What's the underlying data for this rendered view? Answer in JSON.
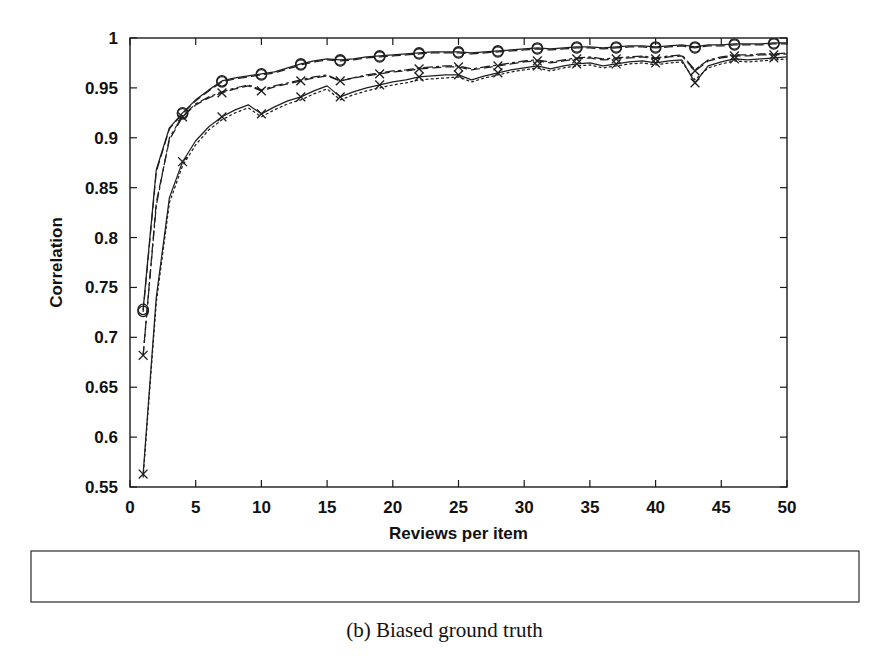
{
  "figure": {
    "caption": "(b) Biased ground truth"
  },
  "chart_data": {
    "type": "line",
    "title": "",
    "xlabel": "Reviews per item",
    "ylabel": "Correlation",
    "xlim": [
      0,
      50
    ],
    "ylim": [
      0.55,
      1.0
    ],
    "xticks": [
      0,
      5,
      10,
      15,
      20,
      25,
      30,
      35,
      40,
      45,
      50
    ],
    "xticklabels": [
      "0",
      "5",
      "10",
      "15",
      "20",
      "25",
      "30",
      "35",
      "40",
      "45",
      "50"
    ],
    "yticks": [
      0.55,
      0.6,
      0.65,
      0.7,
      0.75,
      0.8,
      0.85,
      0.9,
      0.95,
      1.0
    ],
    "yticklabels": [
      "0.55",
      "0.6",
      "0.65",
      "0.7",
      "0.75",
      "0.8",
      "0.85",
      "0.9",
      "0.95",
      "1"
    ],
    "grid": false,
    "legend_position": "below-axes",
    "ticks_direction": "in",
    "frame": "box",
    "x": [
      1,
      2,
      3,
      4,
      5,
      6,
      7,
      8,
      9,
      10,
      11,
      12,
      13,
      14,
      15,
      16,
      17,
      18,
      19,
      20,
      21,
      22,
      23,
      24,
      25,
      26,
      27,
      28,
      29,
      30,
      31,
      32,
      33,
      34,
      35,
      36,
      37,
      38,
      39,
      40,
      41,
      42,
      43,
      44,
      45,
      46,
      47,
      48,
      49,
      50
    ],
    "series": [
      {
        "name": "Mean",
        "linestyle": "dotted",
        "marker": "none",
        "marker_every": 0,
        "color": "#1f1f1f",
        "values": [
          0.56,
          0.735,
          0.835,
          0.872,
          0.893,
          0.908,
          0.918,
          0.925,
          0.93,
          0.921,
          0.928,
          0.934,
          0.938,
          0.944,
          0.949,
          0.938,
          0.943,
          0.947,
          0.95,
          0.953,
          0.955,
          0.958,
          0.959,
          0.96,
          0.961,
          0.956,
          0.96,
          0.963,
          0.966,
          0.968,
          0.97,
          0.967,
          0.97,
          0.972,
          0.973,
          0.97,
          0.972,
          0.974,
          0.975,
          0.973,
          0.975,
          0.976,
          0.958,
          0.97,
          0.974,
          0.977,
          0.976,
          0.977,
          0.978,
          0.979
        ]
      },
      {
        "name": "Bias adjusted mean",
        "linestyle": "dashdot",
        "marker": "none",
        "marker_every": 0,
        "color": "#1f1f1f",
        "values": [
          0.682,
          0.832,
          0.9,
          0.922,
          0.934,
          0.941,
          0.946,
          0.95,
          0.953,
          0.948,
          0.952,
          0.955,
          0.958,
          0.961,
          0.963,
          0.957,
          0.96,
          0.963,
          0.965,
          0.967,
          0.968,
          0.97,
          0.971,
          0.972,
          0.972,
          0.969,
          0.971,
          0.973,
          0.975,
          0.977,
          0.978,
          0.976,
          0.978,
          0.98,
          0.981,
          0.979,
          0.98,
          0.981,
          0.982,
          0.98,
          0.982,
          0.983,
          0.968,
          0.978,
          0.981,
          0.983,
          0.983,
          0.984,
          0.984,
          0.985
        ]
      },
      {
        "name": "Factor analysis",
        "linestyle": "solid",
        "marker": "circle",
        "marker_every": 3,
        "color": "#1f1f1f",
        "values": [
          0.728,
          0.868,
          0.91,
          0.925,
          0.938,
          0.948,
          0.957,
          0.96,
          0.962,
          0.964,
          0.966,
          0.97,
          0.974,
          0.977,
          0.979,
          0.978,
          0.979,
          0.981,
          0.982,
          0.983,
          0.984,
          0.985,
          0.986,
          0.986,
          0.986,
          0.985,
          0.986,
          0.987,
          0.988,
          0.989,
          0.99,
          0.989,
          0.99,
          0.991,
          0.991,
          0.99,
          0.991,
          0.992,
          0.992,
          0.991,
          0.992,
          0.993,
          0.991,
          0.993,
          0.993,
          0.994,
          0.994,
          0.994,
          0.995,
          0.995
        ]
      },
      {
        "name": "Smoothed factor analysis",
        "linestyle": "dashed",
        "marker": "circle",
        "marker_every": 3,
        "color": "#1f1f1f",
        "values": [
          0.726,
          0.866,
          0.909,
          0.924,
          0.937,
          0.947,
          0.956,
          0.959,
          0.961,
          0.963,
          0.965,
          0.969,
          0.973,
          0.976,
          0.978,
          0.977,
          0.978,
          0.98,
          0.981,
          0.982,
          0.983,
          0.984,
          0.985,
          0.985,
          0.985,
          0.984,
          0.985,
          0.986,
          0.987,
          0.988,
          0.989,
          0.988,
          0.989,
          0.99,
          0.99,
          0.989,
          0.99,
          0.991,
          0.991,
          0.99,
          0.991,
          0.992,
          0.99,
          0.992,
          0.992,
          0.993,
          0.993,
          0.993,
          0.994,
          0.994
        ]
      },
      {
        "name": "Asymptotic consensus",
        "linestyle": "dashed",
        "marker": "x",
        "marker_every": 3,
        "color": "#1f1f1f",
        "values": [
          0.682,
          0.835,
          0.898,
          0.921,
          0.933,
          0.94,
          0.945,
          0.949,
          0.952,
          0.947,
          0.951,
          0.954,
          0.957,
          0.96,
          0.962,
          0.957,
          0.96,
          0.962,
          0.964,
          0.966,
          0.967,
          0.969,
          0.97,
          0.971,
          0.971,
          0.968,
          0.97,
          0.972,
          0.974,
          0.976,
          0.977,
          0.975,
          0.977,
          0.979,
          0.98,
          0.978,
          0.979,
          0.98,
          0.981,
          0.979,
          0.981,
          0.982,
          0.967,
          0.977,
          0.98,
          0.982,
          0.982,
          0.983,
          0.983,
          0.984
        ]
      },
      {
        "name": "Bias adjusted asymptotic consensus",
        "linestyle": "solid",
        "marker": "x",
        "marker_every": 3,
        "color": "#1f1f1f",
        "values": [
          0.563,
          0.74,
          0.84,
          0.876,
          0.897,
          0.911,
          0.921,
          0.928,
          0.933,
          0.924,
          0.931,
          0.937,
          0.941,
          0.947,
          0.952,
          0.941,
          0.946,
          0.95,
          0.953,
          0.956,
          0.958,
          0.961,
          0.962,
          0.963,
          0.963,
          0.958,
          0.962,
          0.965,
          0.968,
          0.97,
          0.972,
          0.969,
          0.972,
          0.974,
          0.975,
          0.972,
          0.974,
          0.976,
          0.977,
          0.975,
          0.977,
          0.978,
          0.955,
          0.972,
          0.976,
          0.979,
          0.978,
          0.979,
          0.98,
          0.981
        ]
      }
    ]
  },
  "legend": {
    "entries": [
      {
        "label": "Mean",
        "series": "Mean"
      },
      {
        "label": "Factor analysis",
        "series": "Factor analysis"
      },
      {
        "label": "Asymptotic consensus",
        "series": "Asymptotic consensus"
      },
      {
        "label": "Bias adjusted mean",
        "series": "Bias adjusted mean"
      },
      {
        "label": "Smoothed factor analysis",
        "series": "Smoothed factor analysis"
      },
      {
        "label": "Bias adjused asymptotic consensus",
        "series": "Bias adjusted asymptotic consensus"
      }
    ]
  }
}
